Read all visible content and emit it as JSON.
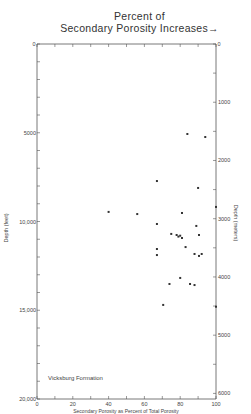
{
  "chart_data": {
    "type": "scatter",
    "title_line1": "Percent of",
    "title_line2": "Secondary Porosity Increases",
    "title_arrow": "→",
    "xlabel": "Secondary Porosity as Percent of Total Porosity",
    "ylabel_left": "Depth (feet)",
    "ylabel_right": "Depth (meters)",
    "annotation": "Vicksburg Formation",
    "xlim": [
      0,
      100
    ],
    "ylim_feet": [
      0,
      20000
    ],
    "ylim_meters": [
      0,
      6096
    ],
    "x_ticks": [
      0,
      20,
      40,
      60,
      80,
      100
    ],
    "x_tick_labels": [
      "0",
      "20",
      "40",
      "60",
      "80",
      "100"
    ],
    "x_minor_step": 10,
    "y_left_ticks": [
      0,
      5000,
      10000,
      15000,
      20000
    ],
    "y_left_tick_labels": [
      "0",
      "5000",
      "10,000",
      "15,000",
      "20,000"
    ],
    "y_left_minor_step": 1000,
    "y_right_ticks": [
      0,
      1000,
      2000,
      3000,
      4000,
      5000,
      6000
    ],
    "y_right_tick_labels": [
      "0",
      "1000",
      "2000",
      "3000",
      "4000",
      "5000",
      "6000"
    ],
    "y_right_minor_step": 500,
    "top_axis_end_labels": [
      "0",
      "0"
    ],
    "grid": false,
    "legend": null,
    "series": [
      {
        "name": "Vicksburg Formation samples",
        "points": [
          {
            "x": 84,
            "y": 5070
          },
          {
            "x": 94,
            "y": 5240
          },
          {
            "x": 67,
            "y": 7720
          },
          {
            "x": 90,
            "y": 8110
          },
          {
            "x": 100,
            "y": 9180
          },
          {
            "x": 40,
            "y": 9460
          },
          {
            "x": 56,
            "y": 9580
          },
          {
            "x": 81,
            "y": 9520
          },
          {
            "x": 67,
            "y": 10140
          },
          {
            "x": 89,
            "y": 10250
          },
          {
            "x": 75,
            "y": 10700
          },
          {
            "x": 78,
            "y": 10760
          },
          {
            "x": 80,
            "y": 10800
          },
          {
            "x": 79,
            "y": 10850
          },
          {
            "x": 90.5,
            "y": 10760
          },
          {
            "x": 81,
            "y": 10930
          },
          {
            "x": 83,
            "y": 11440
          },
          {
            "x": 67,
            "y": 11550
          },
          {
            "x": 67,
            "y": 11890
          },
          {
            "x": 88,
            "y": 11830
          },
          {
            "x": 90.5,
            "y": 11940
          },
          {
            "x": 92,
            "y": 11830
          },
          {
            "x": 80,
            "y": 13180
          },
          {
            "x": 74,
            "y": 13520
          },
          {
            "x": 85.5,
            "y": 13520
          },
          {
            "x": 88,
            "y": 13580
          },
          {
            "x": 70.5,
            "y": 14700
          },
          {
            "x": 100,
            "y": 14800
          }
        ]
      }
    ]
  }
}
